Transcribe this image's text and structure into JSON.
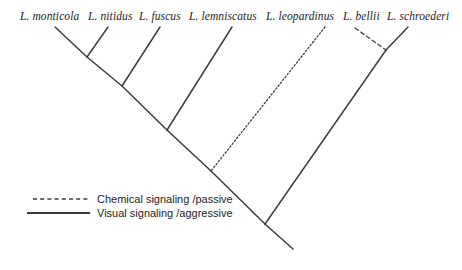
{
  "figure": {
    "type": "phylogenetic-cladogram",
    "background_color": "#ffffff",
    "line_color": "#3a3a3a",
    "width": 462,
    "height": 270
  },
  "taxa": [
    {
      "name": "L. monticola",
      "label_x": 20,
      "label_y": 10,
      "tip_x": 55,
      "tip_y": 27,
      "branch_style": "solid"
    },
    {
      "name": "L. nitidus",
      "label_x": 88,
      "label_y": 10,
      "tip_x": 108,
      "tip_y": 27,
      "branch_style": "solid"
    },
    {
      "name": "L. fuscus",
      "label_x": 139,
      "label_y": 10,
      "tip_x": 160,
      "tip_y": 27,
      "branch_style": "solid"
    },
    {
      "name": "L. lemniscatus",
      "label_x": 189,
      "label_y": 10,
      "tip_x": 232,
      "tip_y": 27,
      "branch_style": "solid"
    },
    {
      "name": "L. leopardinus",
      "label_x": 266,
      "label_y": 10,
      "tip_x": 325,
      "tip_y": 27,
      "branch_style": "dotted"
    },
    {
      "name": "L. bellii",
      "label_x": 343,
      "label_y": 10,
      "tip_x": 355,
      "tip_y": 28,
      "branch_style": "dashed"
    },
    {
      "name": "L. schroederi",
      "label_x": 387,
      "label_y": 10,
      "tip_x": 408,
      "tip_y": 27,
      "branch_style": "solid"
    }
  ],
  "nodes": [
    {
      "id": "node-monticola-nitidus",
      "x": 87,
      "y": 57
    },
    {
      "id": "node-plus-fuscus",
      "x": 122,
      "y": 86
    },
    {
      "id": "node-plus-lemniscatus",
      "x": 167,
      "y": 130
    },
    {
      "id": "node-plus-leopardinus",
      "x": 211,
      "y": 171
    },
    {
      "id": "node-root",
      "x": 265,
      "y": 224
    },
    {
      "id": "node-bellii-schroederi",
      "x": 386,
      "y": 50
    }
  ],
  "branches": [
    {
      "name": "branch-monticola",
      "x1": 55,
      "y1": 27,
      "x2": 87,
      "y2": 57,
      "style": "solid"
    },
    {
      "name": "branch-nitidus",
      "x1": 108,
      "y1": 27,
      "x2": 87,
      "y2": 57,
      "style": "solid"
    },
    {
      "name": "branch-clade-monticola-nitidus-stem",
      "x1": 87,
      "y1": 57,
      "x2": 122,
      "y2": 86,
      "style": "solid"
    },
    {
      "name": "branch-fuscus",
      "x1": 160,
      "y1": 27,
      "x2": 122,
      "y2": 86,
      "style": "solid"
    },
    {
      "name": "branch-clade-fuscus-stem",
      "x1": 122,
      "y1": 86,
      "x2": 167,
      "y2": 130,
      "style": "solid"
    },
    {
      "name": "branch-lemniscatus",
      "x1": 232,
      "y1": 27,
      "x2": 167,
      "y2": 130,
      "style": "solid"
    },
    {
      "name": "branch-clade-lemniscatus-stem",
      "x1": 167,
      "y1": 130,
      "x2": 211,
      "y2": 171,
      "style": "solid"
    },
    {
      "name": "branch-leopardinus",
      "x1": 325,
      "y1": 27,
      "x2": 211,
      "y2": 171,
      "style": "dotted"
    },
    {
      "name": "branch-clade-leopardinus-stem",
      "x1": 211,
      "y1": 171,
      "x2": 265,
      "y2": 224,
      "style": "solid"
    },
    {
      "name": "branch-bellii",
      "x1": 355,
      "y1": 28,
      "x2": 386,
      "y2": 50,
      "style": "dashed"
    },
    {
      "name": "branch-schroederi",
      "x1": 408,
      "y1": 27,
      "x2": 386,
      "y2": 50,
      "style": "solid"
    },
    {
      "name": "branch-clade-bellii-schroederi-stem",
      "x1": 386,
      "y1": 50,
      "x2": 265,
      "y2": 224,
      "style": "solid"
    },
    {
      "name": "branch-root-stem",
      "x1": 265,
      "y1": 224,
      "x2": 293,
      "y2": 249,
      "style": "solid"
    }
  ],
  "legend": {
    "entries": [
      {
        "key": "chemical",
        "label": "Chemical signaling /passive",
        "style": "dashed",
        "line_x1": 33,
        "line_x2": 88,
        "line_y": 199,
        "label_x": 97,
        "label_y": 193
      },
      {
        "key": "visual",
        "label": "Visual signaling /aggressive",
        "style": "solid",
        "line_x1": 27,
        "line_x2": 90,
        "line_y": 213,
        "label_x": 97,
        "label_y": 207
      }
    ]
  }
}
